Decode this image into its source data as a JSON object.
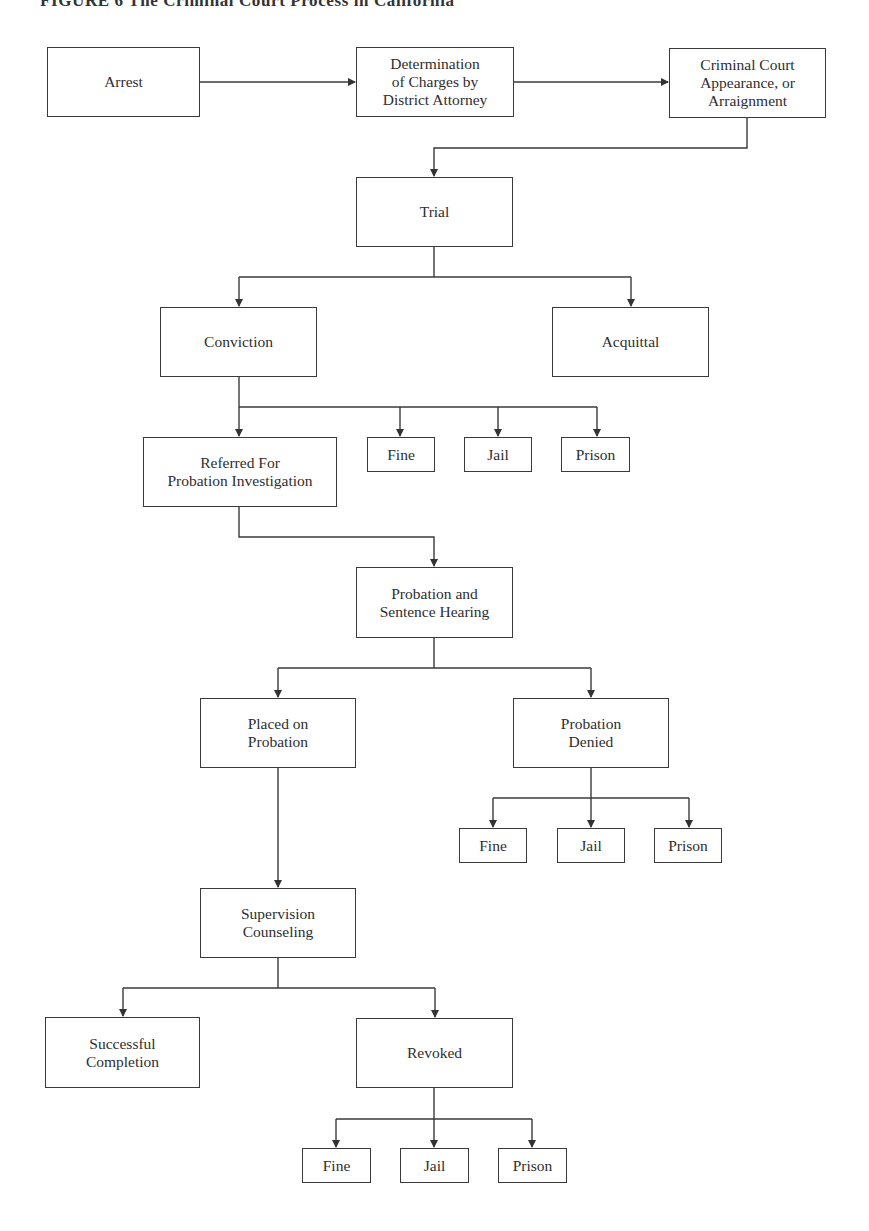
{
  "title": "FIGURE 6  The Criminal Court Process in California",
  "nodes": {
    "arrest": "Arrest",
    "determination": "Determination\nof Charges by\nDistrict Attorney",
    "arraignment": "Criminal Court\nAppearance, or\nArraignment",
    "trial": "Trial",
    "conviction": "Conviction",
    "acquittal": "Acquittal",
    "referred": "Referred For\nProbation Investigation",
    "conv_fine": "Fine",
    "conv_jail": "Jail",
    "conv_prison": "Prison",
    "hearing": "Probation and\nSentence Hearing",
    "placed": "Placed on\nProbation",
    "denied": "Probation\nDenied",
    "denied_fine": "Fine",
    "denied_jail": "Jail",
    "denied_prison": "Prison",
    "supervision": "Supervision\nCounseling",
    "successful": "Successful\nCompletion",
    "revoked": "Revoked",
    "revoked_fine": "Fine",
    "revoked_jail": "Jail",
    "revoked_prison": "Prison"
  },
  "edges": [
    [
      "Arrest",
      "Determination of Charges by District Attorney"
    ],
    [
      "Determination of Charges by District Attorney",
      "Criminal Court Appearance, or Arraignment"
    ],
    [
      "Criminal Court Appearance, or Arraignment",
      "Trial"
    ],
    [
      "Trial",
      "Conviction"
    ],
    [
      "Trial",
      "Acquittal"
    ],
    [
      "Conviction",
      "Referred For Probation Investigation"
    ],
    [
      "Conviction",
      "Fine"
    ],
    [
      "Conviction",
      "Jail"
    ],
    [
      "Conviction",
      "Prison"
    ],
    [
      "Referred For Probation Investigation",
      "Probation and Sentence Hearing"
    ],
    [
      "Probation and Sentence Hearing",
      "Placed on Probation"
    ],
    [
      "Probation and Sentence Hearing",
      "Probation Denied"
    ],
    [
      "Probation Denied",
      "Fine"
    ],
    [
      "Probation Denied",
      "Jail"
    ],
    [
      "Probation Denied",
      "Prison"
    ],
    [
      "Placed on Probation",
      "Supervision Counseling"
    ],
    [
      "Supervision Counseling",
      "Successful Completion"
    ],
    [
      "Supervision Counseling",
      "Revoked"
    ],
    [
      "Revoked",
      "Fine"
    ],
    [
      "Revoked",
      "Jail"
    ],
    [
      "Revoked",
      "Prison"
    ]
  ]
}
